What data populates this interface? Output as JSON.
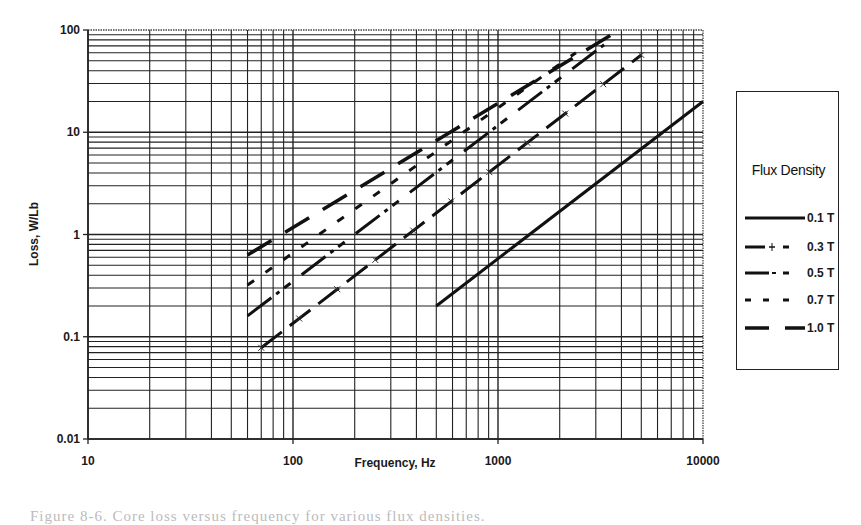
{
  "chart_data": {
    "type": "line",
    "title": "",
    "xlabel": "Frequency, Hz",
    "ylabel": "Loss, W/Lb",
    "xscale": "log",
    "yscale": "log",
    "xlim": [
      10,
      10000
    ],
    "ylim": [
      0.01,
      100
    ],
    "xticks": [
      "10",
      "100",
      "1000",
      "10000"
    ],
    "yticks": [
      "0.01",
      "0.1",
      "1",
      "10",
      "100"
    ],
    "grid": true,
    "legend_title": "Flux Density",
    "legend_position": "right",
    "series": [
      {
        "name": "0.1 T",
        "style": "solid",
        "x": [
          500,
          10000
        ],
        "values": [
          0.2,
          20
        ]
      },
      {
        "name": "0.3 T",
        "style": "long-dash with x markers",
        "x": [
          70,
          5000
        ],
        "values": [
          0.078,
          57
        ]
      },
      {
        "name": "0.5 T",
        "style": "dash-dot",
        "x": [
          60,
          3300
        ],
        "values": [
          0.16,
          72
        ]
      },
      {
        "name": "0.7 T",
        "style": "short-dash",
        "x": [
          60,
          2400
        ],
        "values": [
          0.32,
          60
        ]
      },
      {
        "name": "1.0 T",
        "style": "long-dash",
        "x": [
          60,
          3900
        ],
        "values": [
          0.63,
          100
        ]
      }
    ]
  },
  "axes": {
    "x_title": "Frequency, Hz",
    "y_title": "Loss, W/Lb",
    "x_tick_labels": [
      "10",
      "100",
      "1000",
      "10000"
    ],
    "y_tick_labels": [
      "100",
      "10",
      "1",
      "0.1",
      "0.01"
    ]
  },
  "legend": {
    "title": "Flux Density",
    "items": [
      {
        "label": "0.1 T"
      },
      {
        "label": "0.3 T"
      },
      {
        "label": "0.5 T"
      },
      {
        "label": "0.7 T"
      },
      {
        "label": "1.0 T"
      }
    ]
  },
  "caption": {
    "text": "Figure 8-6. Core loss versus frequency for various flux densities."
  }
}
